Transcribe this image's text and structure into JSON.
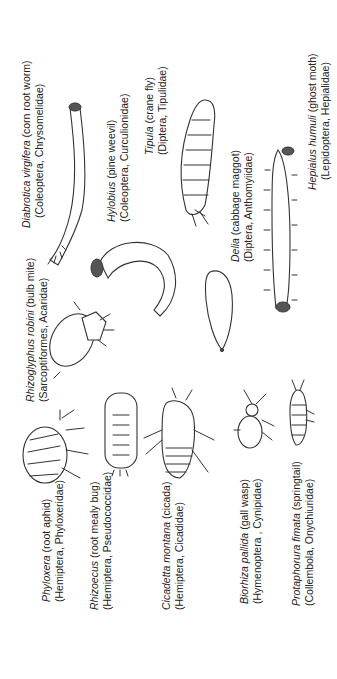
{
  "figure": {
    "orientation": "rotated-90-ccw",
    "organisms": [
      {
        "id": "diabrotica",
        "genus": "Diabrotica virgifera",
        "common": " (corn root worm)",
        "taxon": "(Coleoptera, Chrysomelidae)"
      },
      {
        "id": "hylobius",
        "genus": "Hylobius",
        "common": " (pine weevil)",
        "taxon": "(Coleoptera, Curculionidae)"
      },
      {
        "id": "tipula",
        "genus": "Tipula",
        "common": " (crane fly)",
        "taxon": "(Diptera, Tipulidae)"
      },
      {
        "id": "delia",
        "genus": "Delia",
        "common": " (cabbage maggot)",
        "taxon": "(Diptera, Anthomyiidae)"
      },
      {
        "id": "hepialus",
        "genus": "Hepialus humuli",
        "common": " (ghost moth)",
        "taxon": "(Lepidoptera, Hepialidae)"
      },
      {
        "id": "rhizoglyphus",
        "genus": "Rhizoglyphus robini",
        "common": " (bulb mite)",
        "taxon": "(Sarcoptiformes, Acaridae)"
      },
      {
        "id": "phylloxera",
        "genus": "Phyloxera",
        "common": " (root aphid)",
        "taxon": "(Hemiptera, Phyloxeridae)"
      },
      {
        "id": "rhizoecus",
        "genus": "Rhizoecus",
        "common": " (root mealy bug)",
        "taxon": "(Hemiptera, Pseudococcidae)"
      },
      {
        "id": "cicadetta",
        "genus": "Cicadetta montana",
        "common": " (cicada)",
        "taxon": "(Hemiptera, Cicadidae)"
      },
      {
        "id": "biorhiza",
        "genus": "Biorhiza pallida",
        "common": " (gall wasp)",
        "taxon": "(Hymenoptera , Cynipidae)"
      },
      {
        "id": "protaphorura",
        "genus": "Protaphorura fimata",
        "common": " (springtail)",
        "taxon": "(Collembola, Onychiuridae)"
      }
    ],
    "colors": {
      "line": "#333333",
      "head_capsule": "#555555",
      "background": "#ffffff"
    }
  }
}
